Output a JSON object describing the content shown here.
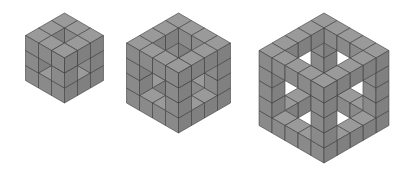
{
  "figure": {
    "background": "#ffffff",
    "colors": {
      "top": "#9a9a9a",
      "left": "#8a8a8a",
      "right": "#808080",
      "edge": "#3c3c3c",
      "inner_dark": "#6e6e6e"
    },
    "cubes": [
      {
        "name": "cube-3x3-hollow",
        "n": 3,
        "cx": 64.5,
        "top_y": 13,
        "size": 15
      },
      {
        "name": "cube-4x4-hollow",
        "n": 4,
        "cx": 178.5,
        "top_y": 13,
        "size": 15
      },
      {
        "name": "cube-5x5-hollow",
        "n": 5,
        "cx": 324,
        "top_y": 13,
        "size": 15
      }
    ]
  }
}
